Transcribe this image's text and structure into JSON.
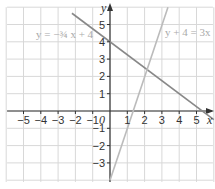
{
  "chart_data": {
    "type": "line",
    "title": "",
    "xlabel": "x",
    "ylabel": "y",
    "origin_label": "0",
    "xlim": [
      -6,
      6
    ],
    "ylim": [
      -4,
      6
    ],
    "grid": true,
    "x_ticks": [
      "-5",
      "-4",
      "-3",
      "-2",
      "-1",
      "1",
      "2",
      "3",
      "4",
      "5"
    ],
    "y_ticks": [
      "5",
      "4",
      "3",
      "2",
      "1",
      "-1",
      "-2",
      "-3"
    ],
    "series": [
      {
        "name": "y = -3/4 x + 4",
        "label_text": "y = −¾ x + 4",
        "color": "#888888",
        "points": [
          [
            -2.2,
            5.65
          ],
          [
            6,
            -0.5
          ]
        ]
      },
      {
        "name": "y + 4 = 3x",
        "label_text": "y + 4 = 3x",
        "color": "#bbbbbb",
        "points": [
          [
            0,
            -4
          ],
          [
            3.35,
            6
          ]
        ]
      }
    ]
  }
}
